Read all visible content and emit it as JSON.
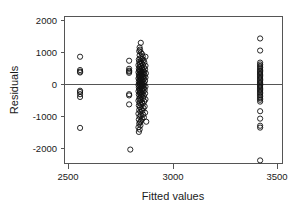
{
  "chart_data": {
    "type": "scatter",
    "title": "",
    "xlabel": "Fitted values",
    "ylabel": "Residuals",
    "xlim": [
      2420,
      3540
    ],
    "ylim": [
      -2500,
      2250
    ],
    "xticks": [
      2500,
      3000,
      3500
    ],
    "xtick_labels": [
      "2500",
      "3000",
      "3500"
    ],
    "yticks": [
      2000,
      1000,
      0,
      -1000,
      -2000
    ],
    "ytick_labels": [
      "2000",
      "1000",
      "0",
      "-1000",
      "-2000"
    ],
    "grid": false,
    "legend": null,
    "reference_lines": [
      {
        "orientation": "horizontal",
        "value": 0,
        "color": "#555555"
      }
    ],
    "marker": {
      "shape": "open-circle",
      "radius_px": 2.6,
      "stroke_color": "#111111",
      "fill": "none"
    },
    "point_count": 171,
    "points": [
      [
        2500,
        950
      ],
      [
        2500,
        520
      ],
      [
        2500,
        470
      ],
      [
        2500,
        440
      ],
      [
        2500,
        -150
      ],
      [
        2500,
        -190
      ],
      [
        2500,
        -260
      ],
      [
        2500,
        -350
      ],
      [
        2500,
        -1350
      ],
      [
        2752,
        820
      ],
      [
        2752,
        560
      ],
      [
        2752,
        500
      ],
      [
        2752,
        470
      ],
      [
        2752,
        430
      ],
      [
        2752,
        -260
      ],
      [
        2752,
        -300
      ],
      [
        2752,
        -590
      ],
      [
        2758,
        -2050
      ],
      [
        2812,
        1400
      ],
      [
        2806,
        1250
      ],
      [
        2808,
        1180
      ],
      [
        2804,
        1130
      ],
      [
        2812,
        1090
      ],
      [
        2818,
        1040
      ],
      [
        2806,
        1000
      ],
      [
        2822,
        960
      ],
      [
        2836,
        950
      ],
      [
        2810,
        900
      ],
      [
        2820,
        880
      ],
      [
        2802,
        860
      ],
      [
        2826,
        840
      ],
      [
        2812,
        810
      ],
      [
        2804,
        790
      ],
      [
        2830,
        770
      ],
      [
        2816,
        750
      ],
      [
        2808,
        720
      ],
      [
        2822,
        700
      ],
      [
        2800,
        680
      ],
      [
        2836,
        660
      ],
      [
        2814,
        640
      ],
      [
        2806,
        620
      ],
      [
        2828,
        600
      ],
      [
        2818,
        580
      ],
      [
        2802,
        560
      ],
      [
        2834,
        545
      ],
      [
        2810,
        530
      ],
      [
        2824,
        515
      ],
      [
        2804,
        500
      ],
      [
        2816,
        490
      ],
      [
        2808,
        475
      ],
      [
        2830,
        460
      ],
      [
        2800,
        450
      ],
      [
        2820,
        440
      ],
      [
        2812,
        425
      ],
      [
        2838,
        415
      ],
      [
        2806,
        400
      ],
      [
        2826,
        390
      ],
      [
        2814,
        375
      ],
      [
        2802,
        360
      ],
      [
        2832,
        350
      ],
      [
        2818,
        335
      ],
      [
        2808,
        320
      ],
      [
        2824,
        305
      ],
      [
        2804,
        290
      ],
      [
        2836,
        280
      ],
      [
        2812,
        265
      ],
      [
        2800,
        250
      ],
      [
        2828,
        240
      ],
      [
        2816,
        225
      ],
      [
        2806,
        210
      ],
      [
        2822,
        195
      ],
      [
        2810,
        180
      ],
      [
        2834,
        170
      ],
      [
        2802,
        155
      ],
      [
        2818,
        140
      ],
      [
        2826,
        125
      ],
      [
        2808,
        110
      ],
      [
        2814,
        95
      ],
      [
        2804,
        80
      ],
      [
        2830,
        70
      ],
      [
        2820,
        55
      ],
      [
        2800,
        40
      ],
      [
        2812,
        25
      ],
      [
        2824,
        10
      ],
      [
        2806,
        -5
      ],
      [
        2836,
        -15
      ],
      [
        2816,
        -30
      ],
      [
        2802,
        -45
      ],
      [
        2828,
        -60
      ],
      [
        2810,
        -75
      ],
      [
        2822,
        -90
      ],
      [
        2804,
        -105
      ],
      [
        2832,
        -120
      ],
      [
        2818,
        -135
      ],
      [
        2808,
        -150
      ],
      [
        2800,
        -165
      ],
      [
        2826,
        -180
      ],
      [
        2814,
        -200
      ],
      [
        2806,
        -220
      ],
      [
        2834,
        -235
      ],
      [
        2820,
        -255
      ],
      [
        2802,
        -275
      ],
      [
        2812,
        -295
      ],
      [
        2828,
        -315
      ],
      [
        2816,
        -340
      ],
      [
        2808,
        -360
      ],
      [
        2824,
        -385
      ],
      [
        2804,
        -405
      ],
      [
        2836,
        -425
      ],
      [
        2810,
        -450
      ],
      [
        2800,
        -470
      ],
      [
        2830,
        -495
      ],
      [
        2818,
        -520
      ],
      [
        2806,
        -545
      ],
      [
        2822,
        -570
      ],
      [
        2814,
        -600
      ],
      [
        2802,
        -625
      ],
      [
        2832,
        -655
      ],
      [
        2808,
        -680
      ],
      [
        2826,
        -710
      ],
      [
        2816,
        -740
      ],
      [
        2804,
        -770
      ],
      [
        2820,
        -800
      ],
      [
        2810,
        -830
      ],
      [
        2834,
        -860
      ],
      [
        2800,
        -890
      ],
      [
        2824,
        -920
      ],
      [
        2812,
        -950
      ],
      [
        2806,
        -985
      ],
      [
        2828,
        -1010
      ],
      [
        2818,
        -1050
      ],
      [
        2802,
        -1080
      ],
      [
        2814,
        -1120
      ],
      [
        2808,
        -1160
      ],
      [
        2804,
        -1210
      ],
      [
        2810,
        -1270
      ],
      [
        2800,
        -1330
      ],
      [
        2806,
        -1400
      ],
      [
        2802,
        -1480
      ],
      [
        2840,
        -1150
      ],
      [
        3425,
        1540
      ],
      [
        3425,
        1150
      ],
      [
        3425,
        760
      ],
      [
        3425,
        700
      ],
      [
        3425,
        650
      ],
      [
        3425,
        600
      ],
      [
        3425,
        550
      ],
      [
        3425,
        505
      ],
      [
        3425,
        465
      ],
      [
        3425,
        425
      ],
      [
        3425,
        385
      ],
      [
        3425,
        345
      ],
      [
        3425,
        300
      ],
      [
        3425,
        260
      ],
      [
        3425,
        215
      ],
      [
        3425,
        175
      ],
      [
        3425,
        130
      ],
      [
        3425,
        90
      ],
      [
        3425,
        50
      ],
      [
        3425,
        10
      ],
      [
        3425,
        -30
      ],
      [
        3425,
        -70
      ],
      [
        3425,
        -115
      ],
      [
        3425,
        -155
      ],
      [
        3425,
        -200
      ],
      [
        3425,
        -245
      ],
      [
        3425,
        -290
      ],
      [
        3425,
        -340
      ],
      [
        3425,
        -390
      ],
      [
        3425,
        -440
      ],
      [
        3425,
        -500
      ],
      [
        3425,
        -810
      ],
      [
        3425,
        -1050
      ],
      [
        3425,
        -1280
      ],
      [
        3425,
        -1340
      ],
      [
        3425,
        -2400
      ]
    ]
  }
}
